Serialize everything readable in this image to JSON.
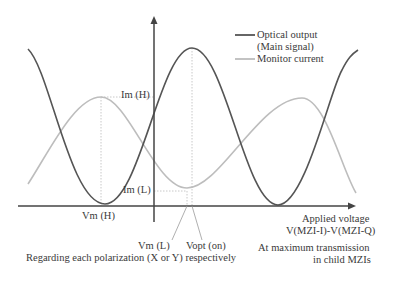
{
  "diagram": {
    "legend": {
      "optical_output_line1": "Optical output",
      "optical_output_line2": "(Main signal)",
      "monitor_current": "Monitor current"
    },
    "labels": {
      "im_h": "Im (H)",
      "im_l": "Im (L)",
      "vm_h": "Vm (H)",
      "vm_l": "Vm (L)",
      "vopt_on": "Vopt (on)",
      "x_axis_line1": "Applied voltage",
      "x_axis_line2": "V(MZI-I)-V(MZI-Q)",
      "note_polarization": "Regarding each polarization (X or Y) respectively",
      "note_transmission_line1": "At maximum transmission",
      "note_transmission_line2": "in child MZIs"
    },
    "colors": {
      "optical_output": "#555555",
      "monitor_current": "#bdbdbd",
      "axis": "#444444",
      "guide": "#c8c8c8",
      "text": "#3a3a3a"
    },
    "series": [
      {
        "name": "Optical output (Main signal)",
        "shape": "cosine",
        "minima_at": [
          "Vm (H)",
          "right of Vopt"
        ],
        "maxima_at": [
          "Vopt (on)"
        ]
      },
      {
        "name": "Monitor current",
        "shape": "cosine (inverted phase)",
        "maxima_at": [
          "Vm (H)"
        ],
        "minima_at": [
          "Vm (L)"
        ],
        "levels": [
          "Im (H)",
          "Im (L)"
        ]
      }
    ]
  }
}
